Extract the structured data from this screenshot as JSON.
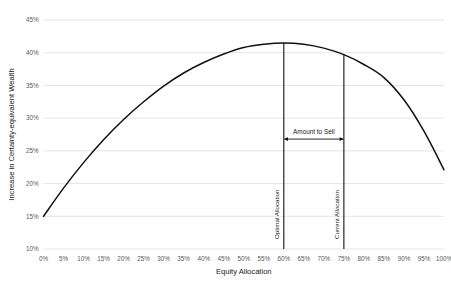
{
  "chart_data": {
    "type": "line",
    "title": "",
    "xlabel": "Equity Allocation",
    "ylabel": "Increase in Certainty-equivalent Wealth",
    "xlim": [
      0,
      100
    ],
    "ylim": [
      10,
      45
    ],
    "grid": true,
    "legend": "none",
    "x_tick_labels": [
      "0%",
      "5%",
      "10%",
      "15%",
      "20%",
      "25%",
      "30%",
      "35%",
      "40%",
      "45%",
      "50%",
      "55%",
      "60%",
      "65%",
      "70%",
      "75%",
      "80%",
      "85%",
      "90%",
      "95%",
      "100%"
    ],
    "y_tick_labels": [
      "10%",
      "15%",
      "20%",
      "25%",
      "30%",
      "35%",
      "40%",
      "45%"
    ],
    "x": [
      0,
      5,
      10,
      15,
      20,
      25,
      30,
      35,
      40,
      45,
      50,
      55,
      60,
      65,
      70,
      75,
      80,
      85,
      90,
      95,
      100
    ],
    "values": [
      15.0,
      19.3,
      23.2,
      26.7,
      29.8,
      32.5,
      34.9,
      36.9,
      38.5,
      39.8,
      40.8,
      41.3,
      41.5,
      41.3,
      40.7,
      39.7,
      38.2,
      36.2,
      32.8,
      28.0,
      22.1
    ],
    "series": [
      {
        "name": "Increase in Certainty-equivalent Wealth",
        "color": "#111111",
        "values": [
          15.0,
          19.3,
          23.2,
          26.7,
          29.8,
          32.5,
          34.9,
          36.9,
          38.5,
          39.8,
          40.8,
          41.3,
          41.5,
          41.3,
          40.7,
          39.7,
          38.2,
          36.2,
          32.8,
          28.0,
          22.1
        ]
      }
    ],
    "annotations": [
      {
        "name": "optimal-allocation",
        "label": "Optimal Allocation",
        "type": "vertical-line",
        "x": 60,
        "y_top": 41.5,
        "y_bottom": 10
      },
      {
        "name": "current-allocation",
        "label": "Current Allocation",
        "type": "vertical-line",
        "x": 75,
        "y_top": 39.7,
        "y_bottom": 10
      },
      {
        "name": "amount-to-sell",
        "label": "Amount to Sell",
        "type": "double-arrow",
        "x_start": 60,
        "x_end": 75,
        "y": 26.8
      }
    ],
    "colors": {
      "line": "#111111",
      "grid": "#d9d9d9",
      "tick_text": "#595959",
      "title_text": "#1a1a1a",
      "background": "#ffffff"
    }
  }
}
